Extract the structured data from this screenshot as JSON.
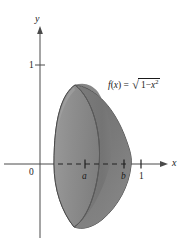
{
  "figure": {
    "type": "solid-of-revolution-diagram",
    "background_color": "#ffffff",
    "axes": {
      "x_axis_label": "x",
      "y_axis_label": "y",
      "origin_label": "0",
      "y_tick_labels": [
        "1"
      ],
      "x_tick_labels": [
        "a",
        "b",
        "1"
      ]
    },
    "function_label": {
      "name": "f",
      "argument": "x",
      "open_paren": "(",
      "close_paren": ")",
      "equals": "=",
      "radical_sign": "√",
      "radicand_first": "1",
      "minus": "−",
      "radicand_var": "x",
      "radicand_exponent": "2",
      "plain_text": "f(x) = √(1 − x²)"
    },
    "solid": {
      "description": "solid of revolution formed by rotating the region under f(x) about the x-axis",
      "front_face_fill": "#8f8f8f",
      "body_fill": "#7e7e7e",
      "shadow_fill": "#6e6e6e",
      "outline_color": "#3a3a3a",
      "axis_of_revolution": "x-axis",
      "interval_start": "a",
      "interval_end": "b"
    },
    "colors": {
      "ink": "#1a1a1a",
      "axis": "#4a4a4a",
      "dash": "#2b2b2b"
    }
  }
}
